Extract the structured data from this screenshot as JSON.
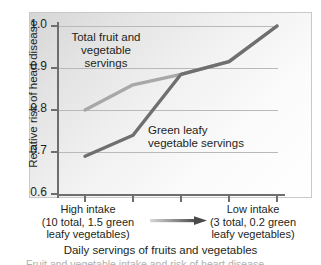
{
  "chart_data": {
    "type": "line",
    "title": "",
    "xlabel": "Daily servings of fruits and vegetables",
    "ylabel": "Relative risk of heart disease",
    "ylim": [
      0.6,
      1.0
    ],
    "y_ticks": [
      "1.0",
      "0.9",
      "0.8",
      "0.7",
      "0.6"
    ],
    "y_tick_values": [
      1.0,
      0.9,
      0.8,
      0.7,
      0.6
    ],
    "grid": true,
    "legend": "inline-labels",
    "x": [
      1,
      2,
      3,
      4,
      5
    ],
    "x_tick_labels": [
      "",
      "",
      "",
      "",
      ""
    ],
    "series": [
      {
        "name": "Total fruit and vegetable servings",
        "color": "#a8a8a8",
        "values": [
          0.8,
          0.86,
          0.885,
          0.915,
          1.0
        ]
      },
      {
        "name": "Green leafy vegetable servings",
        "color": "#706f6f",
        "values": [
          0.69,
          0.74,
          0.885,
          0.915,
          1.0
        ]
      }
    ],
    "annotations": {
      "left_axis_note": "High intake\n(10 total, 1.5 green\nleafy vegetables)",
      "right_axis_note": "Low intake\n(3 total, 0.2 green\nleafy vegetables)",
      "direction_arrow": "left-to-right gradient arrow"
    }
  },
  "figure": {
    "y_axis_title": "Relative risk of heart disease",
    "x_axis_title": "Daily servings of fruits and vegetables",
    "series_label_total": "Total fruit and\nvegetable\nservings",
    "series_label_green": "Green leafy\nvegetable servings",
    "x_note_high": "High intake\n(10 total, 1.5 green\nleafy vegetables)",
    "x_note_low": "Low intake\n(3 total, 0.2 green\nleafy vegetables)",
    "caption_sliver": "Fruit and vegetable intake and risk of heart disease",
    "y_ticks": [
      {
        "label": "1.0"
      },
      {
        "label": "0.9"
      },
      {
        "label": "0.8"
      },
      {
        "label": "0.7"
      },
      {
        "label": "0.6"
      }
    ],
    "colors": {
      "series_total": "#a8a8a8",
      "series_green": "#706f6f",
      "axis": "#6e6e6e",
      "gridline": "#b9b9b9",
      "text": "#231f20"
    }
  }
}
